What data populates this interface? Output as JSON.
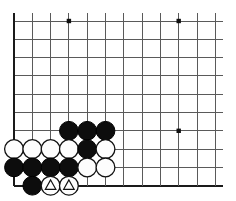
{
  "diagram": {
    "type": "go-board-diagram",
    "board": {
      "columns": 12,
      "rows": 10,
      "origin_x": 14,
      "origin_y": 21,
      "spacing": 18.3,
      "line_color": "#5a5a5a",
      "edge_color": "#1a1a1a",
      "background_color": "#ffffff",
      "has_left_edge": true,
      "has_bottom_edge": true,
      "has_top_edge": false,
      "has_right_edge": false
    },
    "star_points": [
      {
        "name": "star-point-upper-left",
        "col": 3,
        "row": 0
      },
      {
        "name": "star-point-upper-right",
        "col": 9,
        "row": 0
      },
      {
        "name": "star-point-lower-right",
        "col": 9,
        "row": 6
      }
    ],
    "stone_radius": 9.4,
    "stones": [
      {
        "id": "b1",
        "color": "black",
        "col": 3,
        "row": 6,
        "mark": "none"
      },
      {
        "id": "b2",
        "color": "black",
        "col": 4,
        "row": 6,
        "mark": "none"
      },
      {
        "id": "b3",
        "color": "black",
        "col": 5,
        "row": 6,
        "mark": "none"
      },
      {
        "id": "w1",
        "color": "white",
        "col": 0,
        "row": 7,
        "mark": "none"
      },
      {
        "id": "w2",
        "color": "white",
        "col": 1,
        "row": 7,
        "mark": "none"
      },
      {
        "id": "w3",
        "color": "white",
        "col": 2,
        "row": 7,
        "mark": "none"
      },
      {
        "id": "w4",
        "color": "white",
        "col": 3,
        "row": 7,
        "mark": "none"
      },
      {
        "id": "b4",
        "color": "black",
        "col": 4,
        "row": 7,
        "mark": "none"
      },
      {
        "id": "w5",
        "color": "white",
        "col": 5,
        "row": 7,
        "mark": "none"
      },
      {
        "id": "b5",
        "color": "black",
        "col": 0,
        "row": 8,
        "mark": "none"
      },
      {
        "id": "b6",
        "color": "black",
        "col": 1,
        "row": 8,
        "mark": "none"
      },
      {
        "id": "b7",
        "color": "black",
        "col": 2,
        "row": 8,
        "mark": "none"
      },
      {
        "id": "b8",
        "color": "black",
        "col": 3,
        "row": 8,
        "mark": "none"
      },
      {
        "id": "w6",
        "color": "white",
        "col": 4,
        "row": 8,
        "mark": "none"
      },
      {
        "id": "w7",
        "color": "white",
        "col": 5,
        "row": 8,
        "mark": "none"
      },
      {
        "id": "b9",
        "color": "black",
        "col": 1,
        "row": 9,
        "mark": "none"
      },
      {
        "id": "w8",
        "color": "white",
        "col": 2,
        "row": 9,
        "mark": "triangle"
      },
      {
        "id": "w9",
        "color": "white",
        "col": 3,
        "row": 9,
        "mark": "triangle"
      }
    ]
  }
}
